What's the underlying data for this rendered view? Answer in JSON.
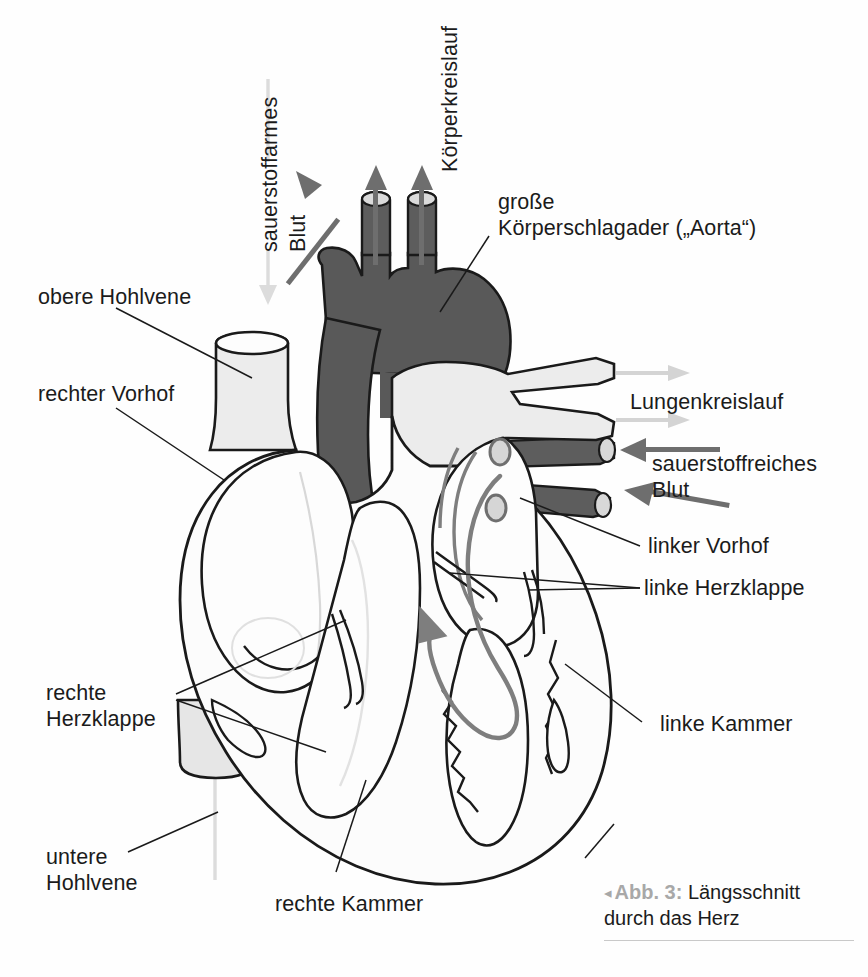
{
  "figure": {
    "caption_prefix": "Abb. 3:",
    "caption_marker": "◂",
    "caption_line1": "Längsschnitt",
    "caption_line2": "durch das Herz"
  },
  "colors": {
    "dark_blood": "#595959",
    "dark_vessel": "#5d5d5d",
    "arrow_dark": "#6e6e6e",
    "arrow_light": "#d2d2d2",
    "flow_gray": "#8a8a8a",
    "tissue_light": "#ececec",
    "tissue_white": "#fdfdfd",
    "outline": "#1a1a1a",
    "caption_gray": "#a8a8a8"
  },
  "labels": {
    "deoxygenated_blood": "sauerstoffarmes\nBlut",
    "deoxygenated_blood_l1": "sauerstoffarmes",
    "deoxygenated_blood_l2": "Blut",
    "systemic_circulation": "Körperkreislauf",
    "aorta_l1": "große",
    "aorta_l2": "Körperschlagader („Aorta“)",
    "superior_vena_cava": "obere Hohlvene",
    "right_atrium": "rechter Vorhof",
    "pulmonary_circulation": "Lungenkreislauf",
    "oxygenated_blood_l1": "sauerstoffreiches",
    "oxygenated_blood_l2": "Blut",
    "left_atrium": "linker Vorhof",
    "left_heart_valve": "linke Herzklappe",
    "left_ventricle": "linke Kammer",
    "right_heart_valve_l1": "rechte",
    "right_heart_valve_l2": "Herzklappe",
    "inferior_vena_cava_l1": "untere",
    "inferior_vena_cava_l2": "Hohlvene",
    "right_ventricle": "rechte Kammer"
  }
}
